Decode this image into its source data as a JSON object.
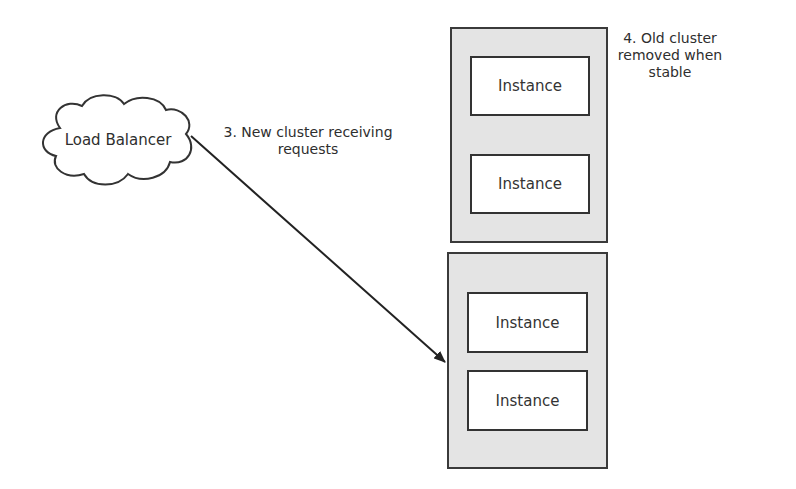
{
  "load_balancer": {
    "label": "Load Balancer"
  },
  "annotations": {
    "new_cluster": {
      "line1": "3. New cluster receiving",
      "line2": "requests"
    },
    "old_cluster": {
      "line1": "4. Old cluster",
      "line2": "removed when",
      "line3": "stable"
    }
  },
  "clusters": {
    "old": {
      "instances": [
        {
          "label": "Instance"
        },
        {
          "label": "Instance"
        }
      ]
    },
    "new": {
      "instances": [
        {
          "label": "Instance"
        },
        {
          "label": "Instance"
        }
      ]
    }
  },
  "colors": {
    "cluster_fill": "#e4e4e4",
    "stroke": "#333333"
  }
}
